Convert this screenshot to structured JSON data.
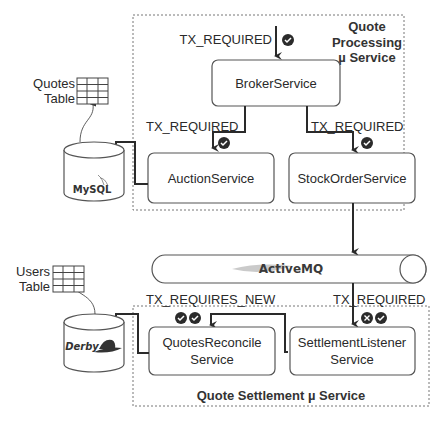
{
  "groups": {
    "quote_processing": {
      "title_line1": "Quote",
      "title_line2": "Processing",
      "title_line3": "µ Service"
    },
    "quote_settlement": {
      "title": "Quote Settlement µ Service"
    }
  },
  "services": {
    "broker": "BrokerService",
    "auction": "AuctionService",
    "stock_order": "StockOrderService",
    "quotes_reconcile_line1": "QuotesReconcile",
    "quotes_reconcile_line2": "Service",
    "settlement_listener_line1": "SettlementListener",
    "settlement_listener_line2": "Service"
  },
  "databases": {
    "mysql": "MySQL",
    "derby": "Derby"
  },
  "tables": {
    "quotes_line1": "Quotes",
    "quotes_line2": "Table",
    "users_line1": "Users",
    "users_line2": "Table"
  },
  "queue": {
    "name": "ActiveMQ"
  },
  "labels": {
    "entry_tx": "TX_REQUIRED",
    "auction_tx": "TX_REQUIRED",
    "stock_tx": "TX_REQUIRED",
    "reconcile_tx": "TX_REQUIRES_NEW",
    "listener_tx": "TX_REQUIRED"
  },
  "status_icons": {
    "entry": [
      "check"
    ],
    "auction": [
      "check"
    ],
    "stock": [
      "check"
    ],
    "reconcile": [
      "check",
      "check"
    ],
    "listener": [
      "cross",
      "check"
    ]
  },
  "colors": {
    "line": "#2a2a2a",
    "badge": "#2b2b2b",
    "box_border": "#555555",
    "dashed": "#777777"
  }
}
